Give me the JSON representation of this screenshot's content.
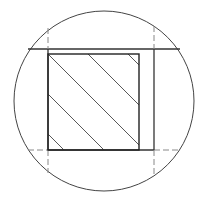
{
  "diagram": {
    "type": "technical-drawing-detail",
    "colors": {
      "background": "#ffffff",
      "stroke": "#333333",
      "hatch": "#444444",
      "dashed": "#777777"
    },
    "circle": {
      "cx": 104,
      "cy": 101,
      "r": 90
    },
    "frame": {
      "top_y": 49,
      "bottom_y": 150,
      "left_x": 48,
      "right_x": 154
    },
    "hatched_square": {
      "x": 48,
      "y": 54,
      "width": 91,
      "height": 96,
      "hatch_angle": "diagonal-down-right",
      "hatch_count": 9
    }
  }
}
